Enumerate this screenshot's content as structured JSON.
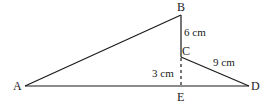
{
  "diagram": {
    "type": "geometry",
    "points": {
      "A": {
        "label": "A",
        "x": 25,
        "y": 86
      },
      "B": {
        "label": "B",
        "x": 181,
        "y": 15
      },
      "C": {
        "label": "C",
        "x": 181,
        "y": 57
      },
      "D": {
        "label": "D",
        "x": 249,
        "y": 86
      },
      "E": {
        "label": "E",
        "x": 181,
        "y": 86
      }
    },
    "segments": [
      {
        "from": "A",
        "to": "B",
        "style": "solid"
      },
      {
        "from": "B",
        "to": "C",
        "style": "solid",
        "length_label": "6 cm"
      },
      {
        "from": "C",
        "to": "D",
        "style": "solid",
        "length_label": "9 cm"
      },
      {
        "from": "A",
        "to": "D",
        "style": "solid"
      },
      {
        "from": "C",
        "to": "E",
        "style": "dashed",
        "length_label": "3 cm"
      }
    ],
    "labels": {
      "bc": "6 cm",
      "cd": "9 cm",
      "ce": "3 cm"
    },
    "colors": {
      "line": "#1a1a1a",
      "background": "#ffffff"
    }
  }
}
